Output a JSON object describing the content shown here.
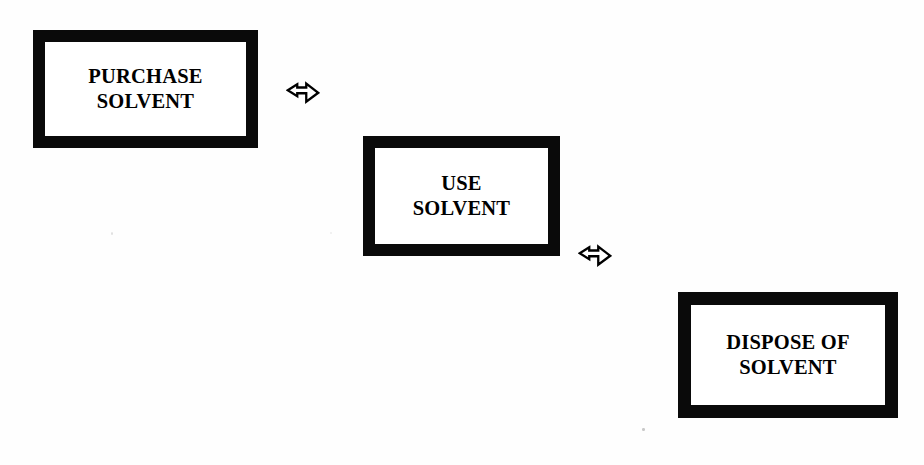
{
  "diagram": {
    "type": "flowchart",
    "orientation": "descending-diagonal",
    "background_color": "#ffffff",
    "ink_color": "#000000",
    "nodes": [
      {
        "id": "purchase",
        "label": "PURCHASE\nSOLVENT",
        "line1": "PURCHASE",
        "line2": "SOLVENT",
        "shape": "rectangle",
        "order": 1
      },
      {
        "id": "use",
        "label": "USE\nSOLVENT",
        "line1": "USE",
        "line2": "SOLVENT",
        "shape": "rectangle",
        "order": 2
      },
      {
        "id": "dispose",
        "label": "DISPOSE OF\nSOLVENT",
        "line1": "DISPOSE OF",
        "line2": "SOLVENT",
        "shape": "rectangle",
        "order": 3
      }
    ],
    "connectors": [
      {
        "id": "purchase-to-use",
        "icon": "block-arrow-right-icon",
        "glyph": "⇨",
        "from": "purchase",
        "to": "use",
        "direction": "right"
      },
      {
        "id": "use-to-dispose",
        "icon": "block-arrow-right-icon",
        "glyph": "⇨",
        "from": "use",
        "to": "dispose",
        "direction": "right"
      }
    ]
  }
}
